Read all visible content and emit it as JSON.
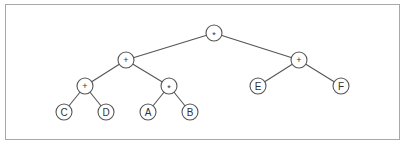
{
  "diagram": {
    "type": "expression-tree",
    "nodes": [
      {
        "id": "n1",
        "label": "*",
        "x": 214,
        "y": 33,
        "kind": "operator"
      },
      {
        "id": "n2",
        "label": "+",
        "x": 126,
        "y": 60,
        "kind": "operator"
      },
      {
        "id": "n3",
        "label": "+",
        "x": 299,
        "y": 60,
        "kind": "operator"
      },
      {
        "id": "n4",
        "label": "+",
        "x": 85,
        "y": 86,
        "kind": "operator"
      },
      {
        "id": "n5",
        "label": "*",
        "x": 169,
        "y": 86,
        "kind": "operator"
      },
      {
        "id": "n6",
        "label": "E",
        "x": 258,
        "y": 86,
        "kind": "operand"
      },
      {
        "id": "n7",
        "label": "F",
        "x": 341,
        "y": 86,
        "kind": "operand"
      },
      {
        "id": "n8",
        "label": "C",
        "x": 64,
        "y": 112,
        "kind": "operand"
      },
      {
        "id": "n9",
        "label": "D",
        "x": 106,
        "y": 112,
        "kind": "operand"
      },
      {
        "id": "n10",
        "label": "A",
        "x": 148,
        "y": 112,
        "kind": "operand"
      },
      {
        "id": "n11",
        "label": "B",
        "x": 190,
        "y": 112,
        "kind": "operand"
      }
    ],
    "edges": [
      [
        "n1",
        "n2"
      ],
      [
        "n1",
        "n3"
      ],
      [
        "n2",
        "n4"
      ],
      [
        "n2",
        "n5"
      ],
      [
        "n3",
        "n6"
      ],
      [
        "n3",
        "n7"
      ],
      [
        "n4",
        "n8"
      ],
      [
        "n4",
        "n9"
      ],
      [
        "n5",
        "n10"
      ],
      [
        "n5",
        "n11"
      ]
    ],
    "node_radius": 8
  }
}
